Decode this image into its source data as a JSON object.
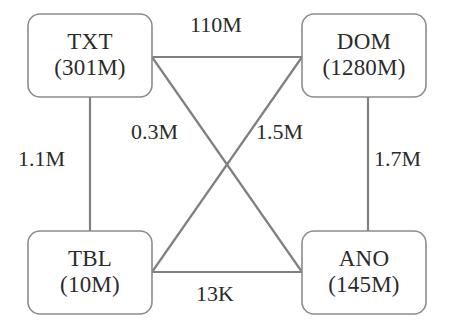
{
  "diagram": {
    "type": "node-link-graph",
    "canvas": {
      "width": 451,
      "height": 328,
      "background": "#ffffff"
    },
    "style": {
      "node_stroke": "#8c8c8c",
      "node_fill": "#ffffff",
      "edge_stroke": "#808080",
      "text_color": "#2b2b2b"
    },
    "nodes": [
      {
        "id": "txt",
        "name": "TXT",
        "count": "(301M)",
        "box": {
          "x": 28,
          "y": 14,
          "w": 124,
          "h": 83,
          "r": 12
        }
      },
      {
        "id": "dom",
        "name": "DOM",
        "count": "(1280M)",
        "box": {
          "x": 302,
          "y": 14,
          "w": 124,
          "h": 83,
          "r": 12
        }
      },
      {
        "id": "tbl",
        "name": "TBL",
        "count": "(10M)",
        "box": {
          "x": 28,
          "y": 231,
          "w": 124,
          "h": 83,
          "r": 12
        }
      },
      {
        "id": "ano",
        "name": "ANO",
        "count": "(145M)",
        "box": {
          "x": 302,
          "y": 231,
          "w": 124,
          "h": 83,
          "r": 12
        }
      }
    ],
    "edges": [
      {
        "id": "txt-dom",
        "source": "TXT",
        "target": "DOM",
        "label": "110M",
        "path": {
          "x1": 152,
          "y1": 57,
          "x2": 302,
          "y2": 57
        },
        "label_pos": {
          "x": 190,
          "y": 14
        }
      },
      {
        "id": "txt-tbl",
        "source": "TXT",
        "target": "TBL",
        "label": "1.1M",
        "path": {
          "x1": 90,
          "y1": 97,
          "x2": 90,
          "y2": 231
        },
        "label_pos": {
          "x": 18,
          "y": 148
        }
      },
      {
        "id": "dom-ano",
        "source": "DOM",
        "target": "ANO",
        "label": "1.7M",
        "path": {
          "x1": 368,
          "y1": 97,
          "x2": 368,
          "y2": 231
        },
        "label_pos": {
          "x": 374,
          "y": 148
        }
      },
      {
        "id": "tbl-ano",
        "source": "TBL",
        "target": "ANO",
        "label": "13K",
        "path": {
          "x1": 152,
          "y1": 272,
          "x2": 302,
          "y2": 272
        },
        "label_pos": {
          "x": 196,
          "y": 283
        }
      },
      {
        "id": "txt-ano",
        "source": "TXT",
        "target": "ANO",
        "label": "0.3M",
        "path": {
          "x1": 152,
          "y1": 57,
          "x2": 302,
          "y2": 272
        },
        "label_pos": {
          "x": 131,
          "y": 121
        }
      },
      {
        "id": "dom-tbl",
        "source": "DOM",
        "target": "TBL",
        "label": "1.5M",
        "path": {
          "x1": 302,
          "y1": 57,
          "x2": 152,
          "y2": 272
        },
        "label_pos": {
          "x": 256,
          "y": 121
        }
      }
    ]
  }
}
